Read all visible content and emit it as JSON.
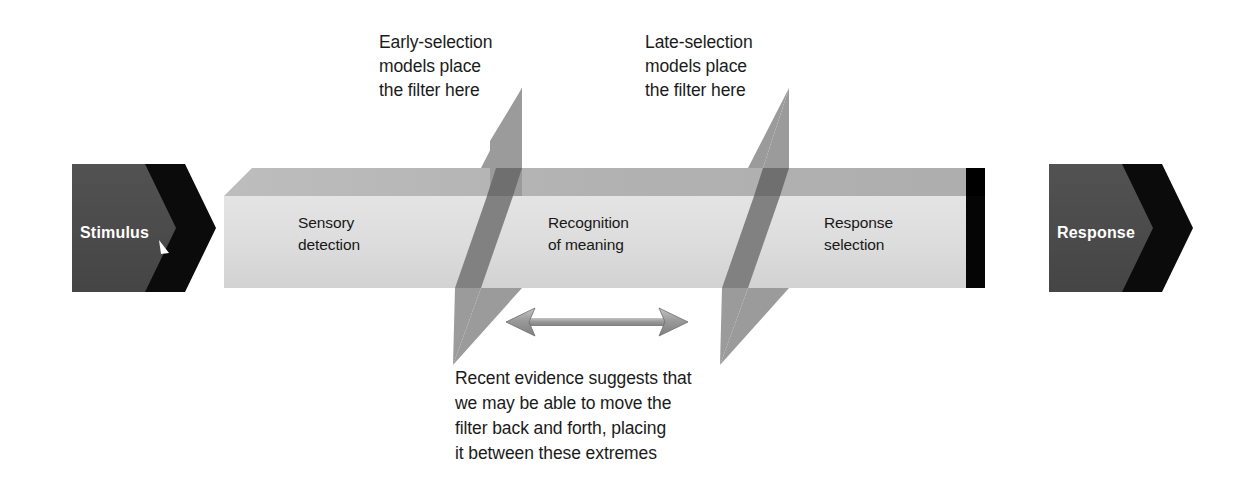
{
  "diagram": {
    "colors": {
      "background": "#ffffff",
      "bar_face": "#dedede",
      "bar_top": "#b4b4b4",
      "bar_left_bevel": "#c9c9c9",
      "bar_shadow": "#000000",
      "badge_fill": "#4a4a4a",
      "badge_shadow": "#0a0a0a",
      "filter_plane": "#9b9b9b",
      "filter_plane_overlap": "#767676",
      "arrow": "#8d8d8d",
      "text": "#1b1b1b",
      "badge_text": "#ffffff"
    },
    "endpoints": {
      "input": {
        "name": "stimulus-badge",
        "label": "Stimulus"
      },
      "output": {
        "name": "response-badge",
        "label": "Response"
      }
    },
    "stages": [
      {
        "name": "sensory-detection",
        "line1": "Sensory",
        "line2": "detection"
      },
      {
        "name": "recognition-of-meaning",
        "line1": "Recognition",
        "line2": "of meaning"
      },
      {
        "name": "response-selection",
        "line1": "Response",
        "line2": "selection"
      }
    ],
    "filters": [
      {
        "name": "early-selection-filter",
        "annotation": {
          "line1": "Early-selection",
          "line2": "models place",
          "line3": "the filter here"
        }
      },
      {
        "name": "late-selection-filter",
        "annotation": {
          "line1": "Late-selection",
          "line2": "models place",
          "line3": "the filter here"
        }
      }
    ],
    "range_note": {
      "name": "filter-range-note",
      "line1": "Recent evidence suggests that",
      "line2": "we may be able to move the",
      "line3": "filter back and forth, placing",
      "line4": "it between these extremes"
    },
    "range_arrow": {
      "name": "double-headed-arrow",
      "direction": "bidirectional"
    }
  }
}
